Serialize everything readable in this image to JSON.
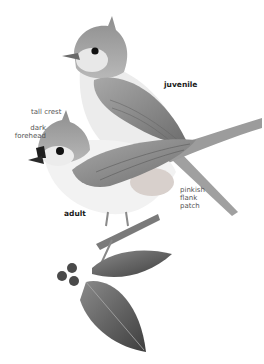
{
  "figure": {
    "labels": {
      "juvenile": "juvenile",
      "tall_crest": "tall crest",
      "dark_forehead": "dark\nforehead",
      "adult": "adult",
      "pinkish_flank": "pinkish\nflank\npatch"
    },
    "colors": {
      "background": "#ffffff",
      "crest_gray": "#9a9a9a",
      "wing_gray": "#8c8c8c",
      "belly": "#f2f2f2",
      "forehead": "#1e1e1e",
      "leaf": "#5a5a5a",
      "berry": "#4a4a4a"
    }
  }
}
